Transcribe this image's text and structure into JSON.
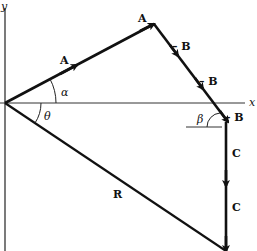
{
  "diagram": {
    "type": "vector addition",
    "axes": {
      "x_label": "x",
      "y_label": "y"
    },
    "vectors": [
      {
        "label": "A",
        "from": "origin",
        "to": "A tip"
      },
      {
        "label": "-B",
        "segments": 3
      },
      {
        "label": "C",
        "segments": 2
      },
      {
        "label": "R",
        "from": "origin",
        "to": "end"
      }
    ],
    "angles": {
      "alpha": "α",
      "theta": "θ",
      "beta": "β"
    },
    "labels": {
      "A1": "A",
      "A2": "A",
      "B1": "– B",
      "B2": "– B",
      "B3": "– B",
      "C1": "C",
      "C2": "C",
      "R": "R",
      "x": "x",
      "y": "y",
      "alpha": "α",
      "theta": "θ",
      "beta": "β"
    },
    "colors": {
      "line": "#111111",
      "axis": "#333333",
      "background": "#ffffff"
    }
  }
}
